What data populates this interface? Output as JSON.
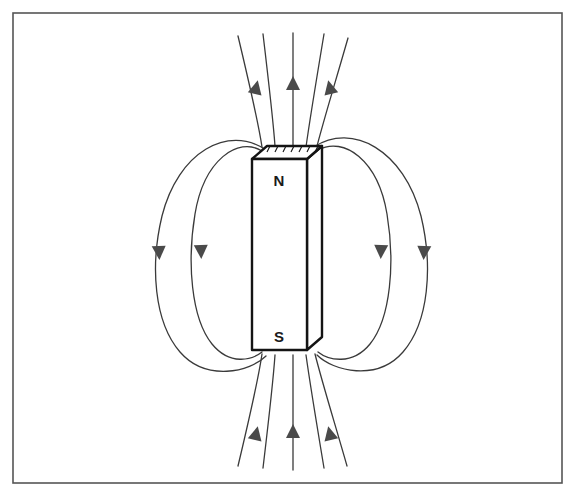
{
  "figure": {
    "canvas": {
      "width": 575,
      "height": 496
    },
    "background_color": "#ffffff",
    "line_color": "#2b2b2b",
    "border": {
      "name": "figure-border",
      "x": 13,
      "y": 13,
      "width": 549,
      "height": 470,
      "stroke_color": "#555555",
      "stroke_width": 1.6
    }
  },
  "magnet": {
    "label_north": "N",
    "label_south": "S",
    "fill_color": "#ffffff",
    "stroke_color": "#141414",
    "stroke_width": 2.4,
    "front_face": {
      "left": 252,
      "right": 307,
      "top": 159,
      "bottom": 350
    },
    "depth_offset": {
      "dx": 15,
      "dy": -13
    },
    "north_label_pos": {
      "x": 279,
      "y": 182
    },
    "south_label_pos": {
      "x": 279,
      "y": 338
    }
  },
  "field_lines": {
    "description": "Magnetic flux lines emerge from the north pole and re-enter at the south pole",
    "stroke_color": "#3a3a3a",
    "stroke_width": 1.3,
    "loop_count_per_side": 2,
    "arrow_color": "#4a4a4a",
    "top_arrow_count": 3,
    "bottom_arrow_count": 3,
    "side_arrow_count_per_side": 2,
    "top_arrow_direction": "up",
    "bottom_arrow_direction": "up",
    "side_arrow_direction": "down"
  }
}
